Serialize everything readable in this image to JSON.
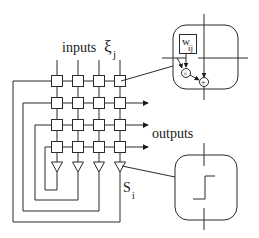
{
  "diagram": {
    "labels": {
      "inputs": "inputs",
      "inputs_symbol": "ξ",
      "inputs_subscript": "j",
      "outputs": "outputs",
      "neuron_symbol": "S",
      "neuron_subscript": "i",
      "weight_symbol": "w",
      "weight_subscript": "ij",
      "multiply_symbol": "×",
      "add_symbol": "+"
    },
    "grid": {
      "rows": 4,
      "columns": 4,
      "column_x": [
        57,
        78,
        99,
        120
      ],
      "row_y": [
        81,
        103,
        125,
        147
      ],
      "node_size": 11
    },
    "neurons": {
      "count": 4,
      "type": "triangle-amplifier"
    },
    "insets": [
      {
        "name": "synapse-detail",
        "content": "weight w_ij, multiplier, adder"
      },
      {
        "name": "neuron-detail",
        "content": "step activation function"
      }
    ],
    "colors": {
      "stroke": "#2a2a2a",
      "background": "#ffffff",
      "text": "#1a1a1a"
    }
  }
}
